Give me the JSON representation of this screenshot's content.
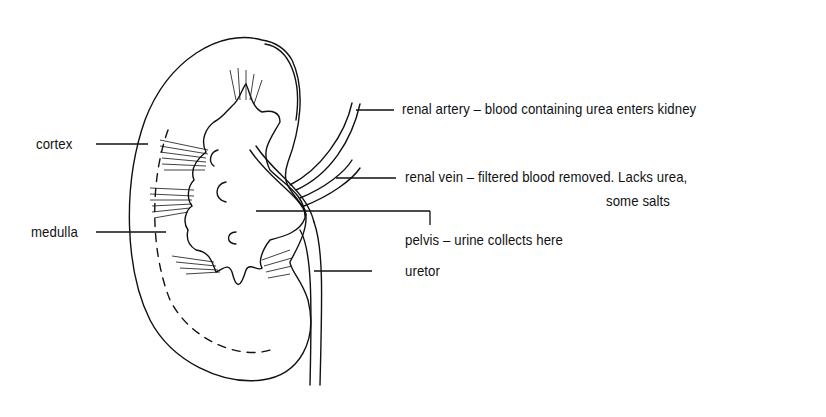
{
  "diagram": {
    "labels": {
      "cortex": "cortex",
      "medulla": "medulla",
      "renal_artery": "renal artery – blood containing urea enters kidney",
      "renal_vein_line1": "renal vein – filtered blood removed. Lacks urea,",
      "renal_vein_line2": "some salts",
      "pelvis": "pelvis – urine collects here",
      "uretor": "uretor"
    },
    "colors": {
      "ink": "#111111",
      "background": "#ffffff"
    }
  }
}
